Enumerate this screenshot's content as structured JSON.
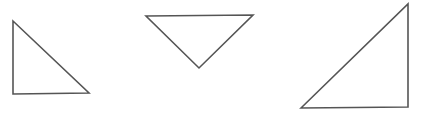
{
  "diagram": {
    "background": "#ffffff",
    "stroke_color": "#555555",
    "shapes": [
      {
        "name": "right-triangle-left",
        "type": "triangle",
        "points": "13,21 13,94 89,93"
      },
      {
        "name": "inverted-triangle-middle",
        "type": "triangle",
        "points": "146,16 253,15 199,68"
      },
      {
        "name": "right-triangle-right",
        "type": "triangle",
        "points": "301,108 408,4 408,107"
      }
    ]
  }
}
